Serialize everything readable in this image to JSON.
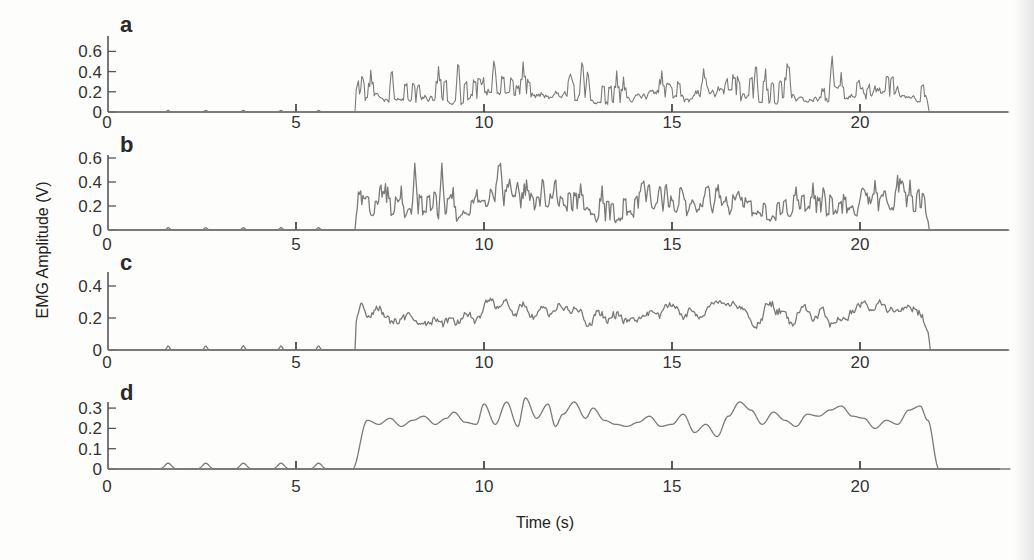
{
  "figure": {
    "ylabel": "EMG Amplitude (V)",
    "xlabel": "Time (s)",
    "colors": {
      "axis": "#555555",
      "trace": "#7a7a7a",
      "text": "#333333"
    }
  },
  "chart_data": [
    {
      "type": "line",
      "panel": "a",
      "title": "a",
      "xlabel": "",
      "ylabel": "EMG Amplitude (V)",
      "xticks": [
        0,
        5,
        10,
        15,
        20
      ],
      "yticks": [
        0,
        0.2,
        0.4,
        0.6
      ],
      "ytick_labels": [
        "0",
        "0.2",
        "0.4",
        "0.6"
      ],
      "xlim": [
        0,
        24
      ],
      "ylim": [
        0,
        0.75
      ],
      "grid": false,
      "description": "Raw rectified EMG; near-zero baseline with small spikes at ~1.5, 3, 4.5, 6, 5.8 s; burst from 6.6 s to 21.8 s",
      "onset_s": 6.6,
      "offset_s": 21.8,
      "baseline_bumps_s": [
        1.6,
        2.6,
        3.6,
        4.6,
        5.6
      ],
      "mean_level": 0.2,
      "peak_level": 0.72,
      "smoothness": 1
    },
    {
      "type": "line",
      "panel": "b",
      "title": "b",
      "xticks": [
        0,
        5,
        10,
        15,
        20
      ],
      "yticks": [
        0,
        0.2,
        0.4,
        0.6
      ],
      "ytick_labels": [
        "0",
        "0.2",
        "0.4",
        "0.6"
      ],
      "xlim": [
        0,
        24
      ],
      "ylim": [
        0,
        0.62
      ],
      "grid": false,
      "description": "Lightly filtered EMG; burst 6.6–21.8 s",
      "onset_s": 6.6,
      "offset_s": 21.8,
      "baseline_bumps_s": [
        1.6,
        2.6,
        3.6,
        4.6,
        5.6
      ],
      "mean_level": 0.22,
      "peak_level": 0.6,
      "smoothness": 2
    },
    {
      "type": "line",
      "panel": "c",
      "title": "c",
      "xticks": [
        0,
        5,
        10,
        15,
        20
      ],
      "yticks": [
        0,
        0.2,
        0.4
      ],
      "ytick_labels": [
        "0",
        "0.2",
        "0.4"
      ],
      "xlim": [
        0,
        24
      ],
      "ylim": [
        0,
        0.48
      ],
      "grid": false,
      "description": "Moderately filtered EMG envelope; burst 6.6–21.8 s",
      "onset_s": 6.6,
      "offset_s": 21.8,
      "baseline_bumps_s": [
        1.6,
        2.6,
        3.6,
        4.6,
        5.6
      ],
      "mean_level": 0.25,
      "peak_level": 0.45,
      "smoothness": 4
    },
    {
      "type": "line",
      "panel": "d",
      "title": "d",
      "xticks": [
        0,
        5,
        10,
        15,
        20
      ],
      "xtick_labels": [
        "0",
        "5",
        "10",
        "15",
        "20"
      ],
      "yticks": [
        0,
        0.1,
        0.2,
        0.3
      ],
      "ytick_labels": [
        "0",
        "0.1",
        "0.2",
        "0.3"
      ],
      "xlim": [
        0,
        24
      ],
      "ylim": [
        0,
        0.33
      ],
      "grid": false,
      "xlabel": "Time (s)",
      "description": "Smoothed EMG envelope; burst 6.6–21.8 s",
      "onset_s": 6.6,
      "offset_s": 21.8,
      "baseline_bumps_s": [
        1.6,
        2.6,
        3.6,
        4.6,
        5.6
      ],
      "x": [
        0,
        6.5,
        6.9,
        7.2,
        7.5,
        7.8,
        8.1,
        8.4,
        8.7,
        9.0,
        9.2,
        9.5,
        9.8,
        10.0,
        10.3,
        10.6,
        10.9,
        11.1,
        11.4,
        11.7,
        11.9,
        12.1,
        12.4,
        12.7,
        12.9,
        13.2,
        13.5,
        13.8,
        14.1,
        14.4,
        14.7,
        15.0,
        15.3,
        15.6,
        15.9,
        16.2,
        16.5,
        16.8,
        17.1,
        17.4,
        17.7,
        18.0,
        18.3,
        18.6,
        18.9,
        19.2,
        19.5,
        19.8,
        20.1,
        20.4,
        20.7,
        21.0,
        21.3,
        21.6,
        21.8,
        22.1,
        24
      ],
      "y": [
        0,
        0,
        0.24,
        0.22,
        0.25,
        0.21,
        0.24,
        0.26,
        0.22,
        0.25,
        0.28,
        0.23,
        0.22,
        0.32,
        0.22,
        0.33,
        0.21,
        0.35,
        0.25,
        0.32,
        0.21,
        0.27,
        0.33,
        0.25,
        0.3,
        0.24,
        0.22,
        0.21,
        0.23,
        0.26,
        0.21,
        0.22,
        0.27,
        0.18,
        0.22,
        0.16,
        0.26,
        0.33,
        0.29,
        0.22,
        0.28,
        0.24,
        0.21,
        0.27,
        0.26,
        0.29,
        0.31,
        0.26,
        0.25,
        0.2,
        0.24,
        0.22,
        0.29,
        0.31,
        0.24,
        0,
        0
      ]
    }
  ]
}
